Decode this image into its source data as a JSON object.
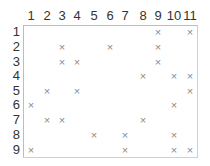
{
  "grid": {
    "columns": [
      "1",
      "2",
      "3",
      "4",
      "5",
      "6",
      "7",
      "8",
      "9",
      "10",
      "11"
    ],
    "rows": [
      "1",
      "2",
      "3",
      "4",
      "5",
      "6",
      "7",
      "8",
      "9"
    ],
    "mark_symbol": "×",
    "marks": [
      {
        "row": 1,
        "col": 9
      },
      {
        "row": 1,
        "col": 11
      },
      {
        "row": 2,
        "col": 3
      },
      {
        "row": 2,
        "col": 6
      },
      {
        "row": 2,
        "col": 9
      },
      {
        "row": 3,
        "col": 3
      },
      {
        "row": 3,
        "col": 4
      },
      {
        "row": 3,
        "col": 9
      },
      {
        "row": 4,
        "col": 8
      },
      {
        "row": 4,
        "col": 10
      },
      {
        "row": 4,
        "col": 11
      },
      {
        "row": 5,
        "col": 2
      },
      {
        "row": 5,
        "col": 4
      },
      {
        "row": 5,
        "col": 11
      },
      {
        "row": 6,
        "col": 1
      },
      {
        "row": 6,
        "col": 10
      },
      {
        "row": 7,
        "col": 2
      },
      {
        "row": 7,
        "col": 3
      },
      {
        "row": 7,
        "col": 8
      },
      {
        "row": 8,
        "col": 5
      },
      {
        "row": 8,
        "col": 7
      },
      {
        "row": 8,
        "col": 10
      },
      {
        "row": 9,
        "col": 1
      },
      {
        "row": 9,
        "col": 7
      },
      {
        "row": 9,
        "col": 10
      },
      {
        "row": 9,
        "col": 11
      }
    ],
    "colors": {
      "label": "#333333",
      "mark": "#8a8a8a",
      "border": "#bdbdbd"
    }
  }
}
